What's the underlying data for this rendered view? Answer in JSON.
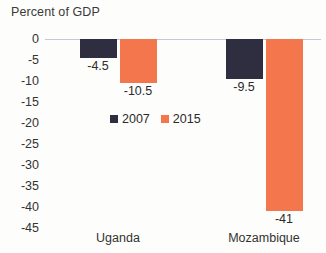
{
  "chart_data": {
    "type": "bar",
    "title": "Percent of GDP",
    "xlabel": "",
    "ylabel": "",
    "ylim": [
      -45,
      0
    ],
    "ytick_step": 5,
    "grid": false,
    "legend_position": "inside-center-left",
    "orientation": "vertical",
    "categories": [
      "Uganda",
      "Mozambique"
    ],
    "series": [
      {
        "name": "2007",
        "color": "#2E2E40",
        "values": [
          -4.5,
          -9.5
        ]
      },
      {
        "name": "2015",
        "color": "#F4764C",
        "values": [
          -10.5,
          -41
        ]
      }
    ],
    "ytick_labels": [
      "0",
      "-5",
      "-10",
      "-15",
      "-20",
      "-25",
      "-30",
      "-35",
      "-40",
      "-45"
    ],
    "data_labels": {
      "uganda_2007": "-4.5",
      "uganda_2015": "-10.5",
      "mozambique_2007": "-9.5",
      "mozambique_2015": "-41"
    }
  },
  "axis": {
    "ticks": [
      {
        "label": "0",
        "value": 0
      },
      {
        "label": "-5",
        "value": -5
      },
      {
        "label": "-10",
        "value": -10
      },
      {
        "label": "-15",
        "value": -15
      },
      {
        "label": "-20",
        "value": -20
      },
      {
        "label": "-25",
        "value": -25
      },
      {
        "label": "-30",
        "value": -30
      },
      {
        "label": "-35",
        "value": -35
      },
      {
        "label": "-40",
        "value": -40
      },
      {
        "label": "-45",
        "value": -45
      }
    ]
  },
  "legend": {
    "items": [
      {
        "label": "2007",
        "color": "#2E2E40"
      },
      {
        "label": "2015",
        "color": "#F4764C"
      }
    ]
  },
  "colors": {
    "series_2007": "#2E2E40",
    "series_2015": "#F4764C",
    "zero_line": "#C9C7D6",
    "background": "#FDFDFB",
    "text": "#2B2B2B"
  }
}
